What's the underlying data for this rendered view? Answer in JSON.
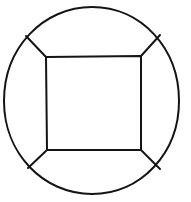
{
  "figure": {
    "style": {
      "background_color": "#ffffff",
      "stroke_color": "#141414",
      "stroke_width": 2,
      "fill": "none"
    },
    "canvas": {
      "width": 191,
      "height": 202
    },
    "shapes": {
      "circle": {
        "name": "outer-circle",
        "center_x": 91,
        "center_y": 100,
        "radius_x": 87,
        "radius_y": 93,
        "left_x": 4,
        "right_x": 179,
        "top_y": 7,
        "bottom_y": 193,
        "path": "M 4,101 C 4,48 43,7 92,7 C 141,7 179,48 179,101 C 179,153 141,194 92,194 C 43,194 4,153 4,101 Z"
      },
      "square": {
        "name": "inner-square",
        "corners": {
          "top_left": {
            "x": 46,
            "y": 57
          },
          "top_right": {
            "x": 141,
            "y": 56
          },
          "bottom_right": {
            "x": 141,
            "y": 150
          },
          "bottom_left": {
            "x": 47,
            "y": 150
          }
        },
        "path": "M 46,57 L 141,56 L 141,150 L 47,150 Z"
      },
      "spokes": [
        {
          "name": "spoke-top-left",
          "from_x": 46,
          "from_y": 57,
          "to_x": 26,
          "to_y": 36,
          "path": "M 46,57 L 26,36"
        },
        {
          "name": "spoke-top-right",
          "from_x": 141,
          "from_y": 56,
          "to_x": 160,
          "to_y": 35,
          "path": "M 141,56 L 160,35"
        },
        {
          "name": "spoke-bottom-right",
          "from_x": 141,
          "from_y": 150,
          "to_x": 160,
          "to_y": 169,
          "path": "M 141,150 L 160,169"
        },
        {
          "name": "spoke-bottom-left",
          "from_x": 47,
          "from_y": 150,
          "to_x": 28,
          "to_y": 168,
          "path": "M 47,150 L 28,168"
        }
      ]
    }
  }
}
